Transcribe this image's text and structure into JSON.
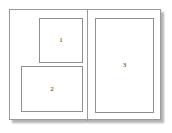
{
  "diagram": {
    "type": "layout-wireframe",
    "colors": {
      "background": "#ffffff",
      "frame_border": "#9a9a9a",
      "box_border": "#8f8f8f",
      "box_fill": "#ffffff",
      "label_text": "#333333",
      "shadow": "rgba(0,0,0,0.30)"
    },
    "panels": [
      {
        "name": "left-panel",
        "boxes": [
          {
            "id": "box-1",
            "label": "1"
          },
          {
            "id": "box-2",
            "label": "2"
          }
        ]
      },
      {
        "name": "right-panel",
        "boxes": [
          {
            "id": "box-3",
            "label": "3"
          }
        ]
      }
    ]
  }
}
